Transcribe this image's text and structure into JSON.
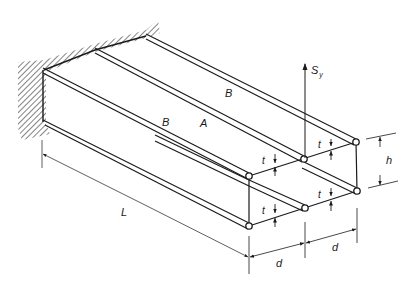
{
  "diagram": {
    "colors": {
      "line": "#1a1a1a",
      "dim": "#3a3a3a",
      "background": "#ffffff"
    },
    "labels": {
      "panel_b_top": "B",
      "panel_b_front": "B",
      "panel_a": "A",
      "load": "S",
      "load_sub": "y",
      "thickness": "t",
      "height": "h",
      "width": "d",
      "length": "L"
    },
    "dimensions": [
      {
        "name": "length",
        "label": "L"
      },
      {
        "name": "height",
        "label": "h"
      },
      {
        "name": "cell-width-1",
        "label": "d"
      },
      {
        "name": "cell-width-2",
        "label": "d"
      },
      {
        "name": "thickness-top-left",
        "label": "t"
      },
      {
        "name": "thickness-top-right",
        "label": "t"
      },
      {
        "name": "thickness-bottom-left",
        "label": "t"
      },
      {
        "name": "thickness-bottom-right",
        "label": "t"
      }
    ]
  }
}
